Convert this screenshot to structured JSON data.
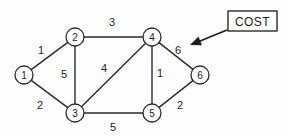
{
  "figure": {
    "kind": "weighted-undirected-graph",
    "background_color": "#fdfdfd",
    "line_color": "#2b2b2b",
    "text_color": "#1d1d1d"
  },
  "nodes": [
    {
      "id": "1",
      "label": "1",
      "x": 24,
      "y": 75,
      "r": 9
    },
    {
      "id": "2",
      "label": "2",
      "x": 75,
      "y": 37,
      "r": 9
    },
    {
      "id": "3",
      "label": "3",
      "x": 75,
      "y": 113,
      "r": 9
    },
    {
      "id": "4",
      "label": "4",
      "x": 152,
      "y": 37,
      "r": 9
    },
    {
      "id": "5",
      "label": "5",
      "x": 152,
      "y": 113,
      "r": 9
    },
    {
      "id": "6",
      "label": "6",
      "x": 200,
      "y": 75,
      "r": 9
    }
  ],
  "edges": [
    {
      "from": "1",
      "to": "2",
      "weight": "1",
      "lx": 41,
      "ly": 50
    },
    {
      "from": "1",
      "to": "3",
      "weight": "2",
      "lx": 40,
      "ly": 105
    },
    {
      "from": "2",
      "to": "3",
      "weight": "5",
      "lx": 64,
      "ly": 74
    },
    {
      "from": "2",
      "to": "4",
      "weight": "3",
      "lx": 112,
      "ly": 22
    },
    {
      "from": "3",
      "to": "4",
      "weight": "4",
      "lx": 104,
      "ly": 68
    },
    {
      "from": "3",
      "to": "5",
      "weight": "5",
      "lx": 113,
      "ly": 127
    },
    {
      "from": "4",
      "to": "5",
      "weight": "1",
      "lx": 160,
      "ly": 73
    },
    {
      "from": "4",
      "to": "6",
      "weight": "6",
      "lx": 178,
      "ly": 50
    },
    {
      "from": "5",
      "to": "6",
      "weight": "2",
      "lx": 180,
      "ly": 105
    }
  ],
  "annotation": {
    "label": "COST",
    "box": {
      "x": 228,
      "y": 11,
      "width": 49,
      "height": 20
    },
    "arrow": {
      "x1": 227,
      "y1": 30,
      "x2": 190,
      "y2": 45
    },
    "points_at_weight": "6"
  }
}
